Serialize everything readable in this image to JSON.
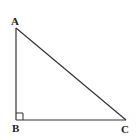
{
  "diagram": {
    "type": "right-triangle",
    "vertices": [
      {
        "label": "A",
        "x": 16,
        "y": 28
      },
      {
        "label": "B",
        "x": 16,
        "y": 120
      },
      {
        "label": "C",
        "x": 126,
        "y": 120
      }
    ],
    "right_angle_at": "B",
    "labels": {
      "a": "A",
      "b": "B",
      "c": "C"
    },
    "stroke_color": "#333333",
    "label_color": "#222222"
  }
}
